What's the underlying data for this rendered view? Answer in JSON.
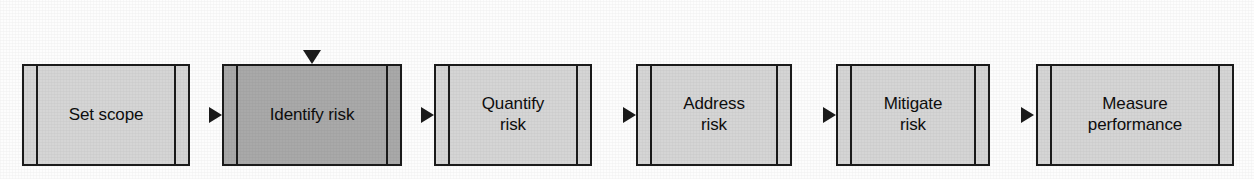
{
  "diagram": {
    "type": "process-flow",
    "orientation": "horizontal",
    "colors": {
      "box_fill_default": "#d5d5d5",
      "box_fill_highlight": "#a9a9a9",
      "stroke": "#1b1b1b",
      "text": "#0d0d0d",
      "background": "#fdfdfd"
    },
    "nodes": [
      {
        "id": "set-scope",
        "label": "Set scope",
        "shape": "predefined-process",
        "fill": "#d5d5d5",
        "highlighted": false,
        "x": 22,
        "y": 64,
        "width": 168,
        "height": 102
      },
      {
        "id": "identify-risk",
        "label": "Identify risk",
        "shape": "predefined-process",
        "fill": "#a9a9a9",
        "highlighted": true,
        "x": 222,
        "y": 64,
        "width": 180,
        "height": 102
      },
      {
        "id": "quantify-risk",
        "label": "Quantify\nrisk",
        "shape": "predefined-process",
        "fill": "#d5d5d5",
        "highlighted": false,
        "x": 434,
        "y": 64,
        "width": 158,
        "height": 102
      },
      {
        "id": "address-risk",
        "label": "Address\nrisk",
        "shape": "predefined-process",
        "fill": "#d5d5d5",
        "highlighted": false,
        "x": 636,
        "y": 64,
        "width": 156,
        "height": 102
      },
      {
        "id": "mitigate-risk",
        "label": "Mitigate\nrisk",
        "shape": "predefined-process",
        "fill": "#d5d5d5",
        "highlighted": false,
        "x": 836,
        "y": 64,
        "width": 154,
        "height": 102
      },
      {
        "id": "measure-performance",
        "label": "Measure\nperformance",
        "shape": "predefined-process",
        "fill": "#d5d5d5",
        "highlighted": false,
        "x": 1036,
        "y": 64,
        "width": 198,
        "height": 102
      }
    ],
    "connectors": [
      {
        "id": "set-scope-to-identify-risk",
        "from": "set-scope",
        "to": "identify-risk",
        "kind": "arrow-right"
      },
      {
        "id": "identify-risk-to-quantify-risk",
        "from": "identify-risk",
        "to": "quantify-risk",
        "kind": "arrow-right"
      },
      {
        "id": "quantify-risk-to-address-risk",
        "from": "quantify-risk",
        "to": "address-risk",
        "kind": "arrow-right"
      },
      {
        "id": "address-risk-to-mitigate-risk",
        "from": "address-risk",
        "to": "mitigate-risk",
        "kind": "arrow-right"
      },
      {
        "id": "mitigate-risk-to-measure-performance",
        "from": "mitigate-risk",
        "to": "measure-performance",
        "kind": "arrow-right"
      },
      {
        "id": "feedback-loop",
        "from": "measure-performance",
        "to": "identify-risk",
        "kind": "feedback-loop-top"
      }
    ]
  }
}
